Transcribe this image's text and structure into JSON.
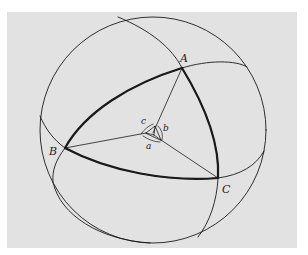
{
  "figure": {
    "colors": {
      "background": "#e2e2e2",
      "page": "#ffffff",
      "stroke": "#1a1a1a"
    },
    "vertices": {
      "A": {
        "label": "A"
      },
      "B": {
        "label": "B"
      },
      "C": {
        "label": "C"
      }
    },
    "angles": {
      "a": {
        "label": "a"
      },
      "b": {
        "label": "b"
      },
      "c": {
        "label": "c"
      }
    }
  }
}
